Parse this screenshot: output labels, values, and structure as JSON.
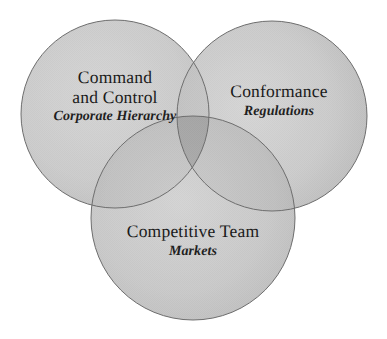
{
  "diagram": {
    "type": "venn",
    "title": "",
    "background_color": "#ffffff",
    "circle_fill": "#cccccc",
    "circle_stroke": "#6e6e6e",
    "text_color": "#1a1a1a",
    "sets": [
      {
        "id": "command-and-control",
        "title": "Command",
        "title_line2": "and Control",
        "subtitle": "Corporate Hierarchy",
        "position": "top-left",
        "center_x": 115,
        "center_y": 114,
        "radius": 94
      },
      {
        "id": "conformance",
        "title": "Conformance",
        "subtitle": "Regulations",
        "position": "top-right",
        "center_x": 272,
        "center_y": 116,
        "radius": 95
      },
      {
        "id": "competitive-team",
        "title": "Competitive Team",
        "subtitle": "Markets",
        "position": "bottom-center",
        "center_x": 193,
        "center_y": 218,
        "radius": 102
      }
    ]
  }
}
